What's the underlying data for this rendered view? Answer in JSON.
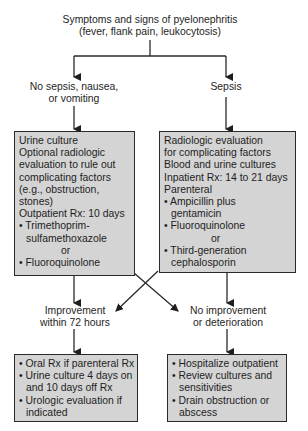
{
  "title": {
    "line1": "Symptoms and signs of pyelonephritis",
    "line2": "(fever, flank pain, leukocytosis)"
  },
  "branches": {
    "left": {
      "line1": "No sepsis, nausea,",
      "line2": "or vomiting"
    },
    "right": {
      "line1": "Sepsis"
    }
  },
  "left_box": {
    "lines": [
      "Urine culture",
      "Optional radiologic",
      "evaluation to rule out",
      "complicating factors",
      "(e.g., obstruction,",
      "stones)",
      "Outpatient Rx: 10 days"
    ],
    "bullet1_a": "• Trimethoprim-",
    "bullet1_b": "sulfamethoxazole",
    "or": "or",
    "bullet2": "• Fluoroquinolone"
  },
  "right_box": {
    "lines": [
      "Radiologic evaluation",
      "for complicating factors",
      "Blood and urine cultures",
      "Inpatient Rx: 14 to 21 days",
      "Parenteral"
    ],
    "bullet1_a": "• Ampicillin plus",
    "bullet1_b": "gentamicin",
    "bullet2": "• Fluoroquinolone",
    "or": "or",
    "bullet3_a": "• Third-generation",
    "bullet3_b": "cephalosporin"
  },
  "outcomes": {
    "left": {
      "line1": "Improvement",
      "line2": "within 72 hours"
    },
    "right": {
      "line1": "No improvement",
      "line2": "or deterioration"
    }
  },
  "bottom_left_box": {
    "b1": "• Oral Rx if parenteral Rx",
    "b2a": "• Urine culture 4 days on",
    "b2b": "and 10 days off Rx",
    "b3a": "• Urologic evaluation if",
    "b3b": "indicated"
  },
  "bottom_right_box": {
    "b1": "• Hospitalize outpatient",
    "b2a": "• Review cultures and",
    "b2b": "sensitivities",
    "b3a": "• Drain obstruction or",
    "b3b": "abscess"
  },
  "colors": {
    "box_fill": "#d4d4d4",
    "line": "#2a2a2a",
    "text": "#1e1e1e"
  }
}
